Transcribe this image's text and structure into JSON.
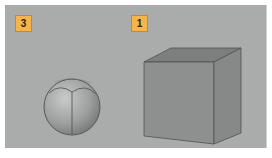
{
  "viewport": {
    "background": "#a9acaa",
    "labels": [
      {
        "id": "3",
        "text": "3",
        "color": "#f6b54a"
      },
      {
        "id": "1",
        "text": "1",
        "color": "#f6b54a"
      }
    ],
    "objects": [
      {
        "name": "sphere",
        "label": "3"
      },
      {
        "name": "cube",
        "label": "1"
      }
    ]
  }
}
